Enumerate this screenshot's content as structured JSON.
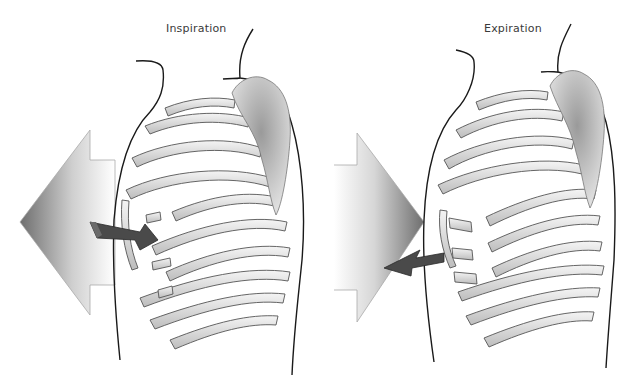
{
  "figure": {
    "panels": [
      {
        "id": "inspiration",
        "label": "Inspiration",
        "large_arrow_direction": "left (outward, chest expands)",
        "small_arrow_direction": "inward toward ribs (ribs rise)"
      },
      {
        "id": "expiration",
        "label": "Expiration",
        "large_arrow_direction": "right (inward, chest contracts)",
        "small_arrow_direction": "outward/down away from ribs (ribs fall)"
      }
    ],
    "colors": {
      "background": "#ffffff",
      "outline": "#1a1a1a",
      "rib_fill": "#d9d9d9",
      "rib_highlight": "#f2f2f2",
      "arrow_dark": "#4a4a4a",
      "large_arrow_gradient_dark": "#7a7a7a",
      "large_arrow_gradient_light": "#ffffff",
      "scapula": "#b8b8b8"
    }
  }
}
